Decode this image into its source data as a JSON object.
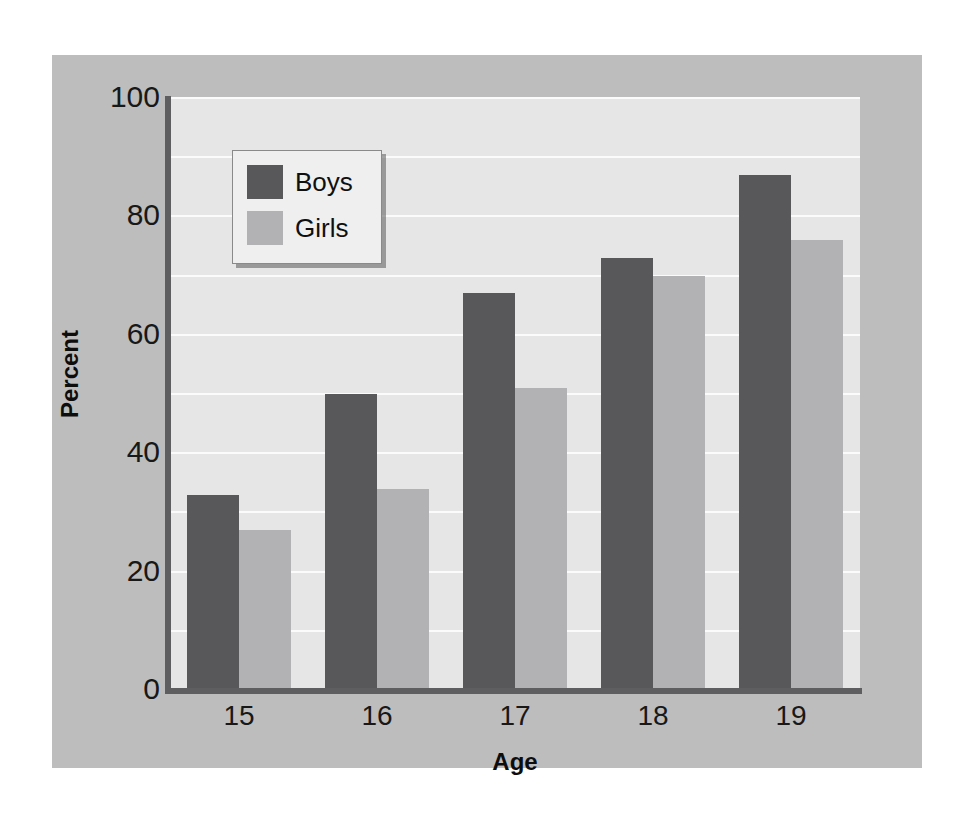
{
  "chart_data": {
    "type": "bar",
    "title": "",
    "subtitle": "",
    "xlabel": "Age",
    "ylabel": "Percent",
    "categories": [
      "15",
      "16",
      "17",
      "18",
      "19"
    ],
    "series": [
      {
        "name": "Boys",
        "color": "#58585a",
        "values": [
          33,
          50,
          67,
          73,
          87
        ]
      },
      {
        "name": "Girls",
        "color": "#b2b2b4",
        "values": [
          27,
          34,
          51,
          70,
          76
        ]
      }
    ],
    "ylim": [
      0,
      100
    ],
    "yticks": [
      0,
      20,
      40,
      60,
      80,
      100
    ],
    "ytick_labels": [
      "0",
      "20",
      "40",
      "60",
      "80",
      "100"
    ],
    "gridlines_every": 10,
    "grid": true,
    "grid_color": "#fbfbfb",
    "legend_position": "upper-left-inside",
    "legend_entries": [
      "Boys",
      "Girls"
    ],
    "plot_background": "#e6e6e6",
    "panel_background": "#bdbdbd",
    "axis_color": "#5e5e60"
  }
}
